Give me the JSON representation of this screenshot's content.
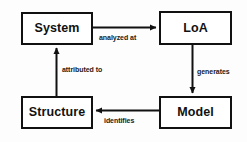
{
  "diagram": {
    "background_color": "#fdfdfd",
    "stroke_color": "#111111",
    "node_fill": "#ffffff",
    "nodes": [
      {
        "id": "system",
        "label": "System"
      },
      {
        "id": "loa",
        "label": "LoA"
      },
      {
        "id": "model",
        "label": "Model"
      },
      {
        "id": "structure",
        "label": "Structure"
      }
    ],
    "edges": [
      {
        "id": "system-to-loa",
        "label": "analyzed at",
        "from": "System",
        "to": "LoA",
        "direction": "right"
      },
      {
        "id": "loa-to-model",
        "label": "generates",
        "from": "LoA",
        "to": "Model",
        "direction": "down"
      },
      {
        "id": "model-to-structure",
        "label": "identifies",
        "from": "Model",
        "to": "Structure",
        "direction": "left"
      },
      {
        "id": "structure-to-system",
        "label": "attributed to",
        "from": "Structure",
        "to": "System",
        "direction": "up"
      }
    ]
  }
}
